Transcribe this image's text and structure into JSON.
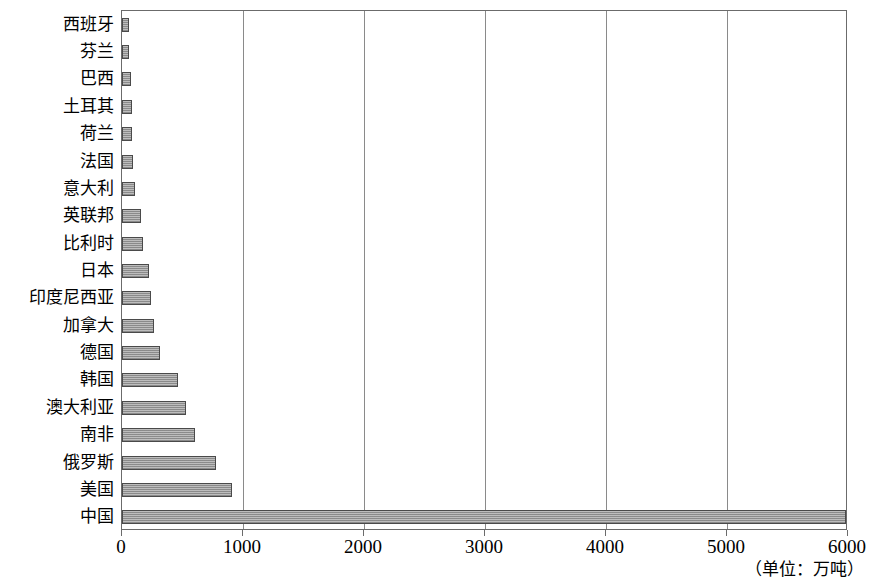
{
  "chart_data": {
    "type": "bar",
    "orientation": "horizontal",
    "title": "",
    "xlabel": "",
    "ylabel": "",
    "unit_note": "（单位：万吨）",
    "xlim": [
      0,
      6000
    ],
    "xticks": [
      0,
      1000,
      2000,
      3000,
      4000,
      5000,
      6000
    ],
    "xtick_labels": [
      "0",
      "1000",
      "2000",
      "3000",
      "4000",
      "5000",
      "6000"
    ],
    "grid": true,
    "grid_axis": "x",
    "legend": "none",
    "categories": [
      "西班牙",
      "芬兰",
      "巴西",
      "土耳其",
      "荷兰",
      "法国",
      "意大利",
      "英联邦",
      "比利时",
      "日本",
      "印度尼西亚",
      "加拿大",
      "德国",
      "韩国",
      "澳大利亚",
      "南非",
      "俄罗斯",
      "美国",
      "中国"
    ],
    "values": [
      60,
      60,
      75,
      80,
      85,
      90,
      110,
      155,
      175,
      225,
      240,
      265,
      315,
      460,
      530,
      600,
      780,
      910,
      5980
    ],
    "bar_fill_color": "#9a9a9a",
    "bar_edge_color": "#4a4a4a",
    "axis_color": "#6b6b6b",
    "background_color": "#ffffff"
  }
}
